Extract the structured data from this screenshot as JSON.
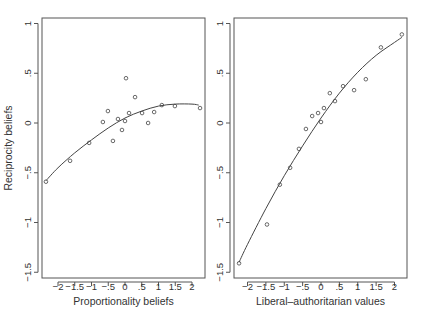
{
  "chart_data": [
    {
      "type": "scatter",
      "panel": "left",
      "title": "",
      "xlabel": "Proportionality beliefs",
      "ylabel": "Reciprocity beliefs",
      "xlim": [
        -2.5,
        2.35
      ],
      "ylim": [
        -1.55,
        1.05
      ],
      "xticks": [
        -2,
        -1.5,
        -1,
        -0.5,
        0,
        0.5,
        1,
        1.5,
        2
      ],
      "xtick_labels": [
        "−2",
        "−1.5",
        "−1",
        "−.5",
        "0",
        ".5",
        "1",
        "1.5",
        "2"
      ],
      "yticks": [
        -1.5,
        -1,
        -0.5,
        0,
        0.5,
        1
      ],
      "ytick_labels": [
        "−1.5",
        "−1",
        "−.5",
        "0",
        ".5",
        "1"
      ],
      "grid": false,
      "points": [
        [
          -2.36,
          -0.59
        ],
        [
          -1.64,
          -0.38
        ],
        [
          -1.07,
          -0.2
        ],
        [
          -0.66,
          0.01
        ],
        [
          -0.51,
          0.12
        ],
        [
          -0.36,
          -0.18
        ],
        [
          -0.21,
          0.04
        ],
        [
          -0.09,
          -0.07
        ],
        [
          0.03,
          0.45
        ],
        [
          0.0,
          0.02
        ],
        [
          0.12,
          0.1
        ],
        [
          0.3,
          0.26
        ],
        [
          0.51,
          0.1
        ],
        [
          0.69,
          0.0
        ],
        [
          0.87,
          0.11
        ],
        [
          1.1,
          0.18
        ],
        [
          1.49,
          0.17
        ],
        [
          2.24,
          0.15
        ]
      ],
      "fit_curve": [
        [
          -2.36,
          -0.58
        ],
        [
          -2.0,
          -0.45
        ],
        [
          -1.5,
          -0.3
        ],
        [
          -1.0,
          -0.17
        ],
        [
          -0.5,
          -0.05
        ],
        [
          0.0,
          0.05
        ],
        [
          0.5,
          0.12
        ],
        [
          1.0,
          0.17
        ],
        [
          1.5,
          0.19
        ],
        [
          2.0,
          0.19
        ],
        [
          2.2,
          0.18
        ]
      ]
    },
    {
      "type": "scatter",
      "panel": "right",
      "title": "",
      "xlabel": "Liberal–authoritarian values",
      "ylabel": "",
      "xlim": [
        -2.4,
        2.35
      ],
      "ylim": [
        -1.55,
        1.05
      ],
      "xticks": [
        -2,
        -1.5,
        -1,
        -0.5,
        0,
        0.5,
        1,
        1.5,
        2
      ],
      "xtick_labels": [
        "−2",
        "−1.5",
        "−1",
        "−.5",
        "0",
        ".5",
        "1",
        "1.5",
        "2"
      ],
      "yticks": [
        -1.5,
        -1,
        -0.5,
        0,
        0.5,
        1
      ],
      "ytick_labels": [
        "−1.5",
        "−1",
        "−.5",
        "0",
        ".5",
        "1"
      ],
      "grid": false,
      "points": [
        [
          -2.23,
          -1.41
        ],
        [
          -1.47,
          -1.02
        ],
        [
          -1.12,
          -0.62
        ],
        [
          -0.84,
          -0.45
        ],
        [
          -0.6,
          -0.26
        ],
        [
          -0.41,
          -0.06
        ],
        [
          -0.24,
          0.07
        ],
        [
          -0.08,
          0.1
        ],
        [
          0.0,
          0.01
        ],
        [
          0.08,
          0.15
        ],
        [
          0.24,
          0.3
        ],
        [
          0.38,
          0.22
        ],
        [
          0.6,
          0.37
        ],
        [
          0.9,
          0.33
        ],
        [
          1.22,
          0.44
        ],
        [
          1.63,
          0.76
        ],
        [
          2.2,
          0.89
        ]
      ],
      "fit_curve": [
        [
          -2.23,
          -1.4
        ],
        [
          -2.0,
          -1.22
        ],
        [
          -1.5,
          -0.86
        ],
        [
          -1.0,
          -0.53
        ],
        [
          -0.5,
          -0.23
        ],
        [
          0.0,
          0.05
        ],
        [
          0.5,
          0.3
        ],
        [
          1.0,
          0.51
        ],
        [
          1.5,
          0.68
        ],
        [
          2.0,
          0.81
        ],
        [
          2.2,
          0.86
        ]
      ]
    }
  ]
}
